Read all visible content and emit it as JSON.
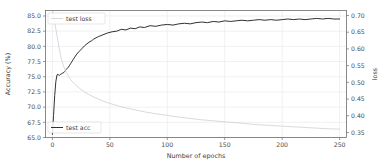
{
  "chart_data": {
    "type": "line",
    "title": "",
    "xlabel": "Number of epochs",
    "ylabel": "Accuracy (%)",
    "y2label": "loss",
    "xlim": [
      -6,
      256
    ],
    "ylim": [
      65.0,
      85.9
    ],
    "y2lim": [
      0.335,
      0.715
    ],
    "xticks": [
      0,
      50,
      100,
      150,
      200,
      250
    ],
    "xticklabels": [
      "0",
      "50",
      "100",
      "150",
      "200",
      "250"
    ],
    "yticks": [
      65.0,
      67.5,
      70.0,
      72.5,
      75.0,
      77.5,
      80.0,
      82.5,
      85.0
    ],
    "yticklabels": [
      "65.0",
      "67.5",
      "70.0",
      "72.5",
      "75.0",
      "77.5",
      "80.0",
      "82.5",
      "85.0"
    ],
    "y2ticks": [
      0.35,
      0.4,
      0.45,
      0.5,
      0.55,
      0.6,
      0.65,
      0.7
    ],
    "y2ticklabels": [
      "0.35",
      "0.40",
      "0.45",
      "0.50",
      "0.55",
      "0.60",
      "0.65",
      "0.70"
    ],
    "grid": true,
    "legend_position": "upper-left-and-lower-left",
    "series": [
      {
        "name": "test acc",
        "axis": "left",
        "color": "#1a1a1a",
        "linewidth": 0.9,
        "legend_label": "test acc",
        "x": [
          0,
          1,
          2,
          3,
          4,
          5,
          6,
          7,
          8,
          9,
          10,
          11,
          12,
          13,
          14,
          15,
          16,
          17,
          18,
          19,
          20,
          22,
          24,
          26,
          28,
          30,
          32,
          34,
          36,
          38,
          40,
          44,
          48,
          52,
          56,
          60,
          64,
          68,
          72,
          76,
          80,
          85,
          90,
          95,
          100,
          105,
          110,
          115,
          120,
          125,
          130,
          135,
          140,
          145,
          150,
          155,
          160,
          165,
          170,
          175,
          180,
          185,
          190,
          195,
          200,
          205,
          210,
          215,
          220,
          225,
          230,
          235,
          240,
          245,
          250
        ],
        "y": [
          65.5,
          68.6,
          71.9,
          74.2,
          75.3,
          75.4,
          75.2,
          75.4,
          75.5,
          75.6,
          75.7,
          75.9,
          76.2,
          76.4,
          76.6,
          76.9,
          77.2,
          77.5,
          77.8,
          78.1,
          78.4,
          78.9,
          79.3,
          79.7,
          80.1,
          80.4,
          80.7,
          80.9,
          81.2,
          81.4,
          81.6,
          81.9,
          82.2,
          82.4,
          82.5,
          82.8,
          82.7,
          83.0,
          82.9,
          83.2,
          83.1,
          83.4,
          83.3,
          83.5,
          83.6,
          83.5,
          83.7,
          83.8,
          83.7,
          83.9,
          84.0,
          83.9,
          84.1,
          84.0,
          84.2,
          84.1,
          84.2,
          84.3,
          84.2,
          84.3,
          84.4,
          84.3,
          84.4,
          84.3,
          84.4,
          84.5,
          84.4,
          84.5,
          84.4,
          84.5,
          84.6,
          84.5,
          84.6,
          84.5,
          84.5
        ]
      },
      {
        "name": "test loss",
        "axis": "right",
        "color": "#cfcfcf",
        "linewidth": 0.8,
        "legend_label": "test loss",
        "x": [
          0,
          1,
          2,
          3,
          4,
          5,
          6,
          7,
          8,
          9,
          10,
          12,
          14,
          16,
          18,
          20,
          24,
          28,
          32,
          36,
          40,
          45,
          50,
          55,
          60,
          70,
          80,
          90,
          100,
          110,
          120,
          130,
          140,
          150,
          160,
          170,
          180,
          190,
          200,
          210,
          220,
          230,
          240,
          250
        ],
        "y": [
          0.715,
          0.7,
          0.68,
          0.66,
          0.64,
          0.62,
          0.6,
          0.583,
          0.568,
          0.556,
          0.546,
          0.53,
          0.518,
          0.508,
          0.5,
          0.493,
          0.481,
          0.471,
          0.463,
          0.456,
          0.45,
          0.443,
          0.437,
          0.432,
          0.427,
          0.419,
          0.412,
          0.406,
          0.401,
          0.396,
          0.392,
          0.388,
          0.385,
          0.382,
          0.379,
          0.376,
          0.373,
          0.371,
          0.369,
          0.367,
          0.365,
          0.363,
          0.361,
          0.36
        ]
      }
    ]
  },
  "legend_top": {
    "label": "test loss"
  },
  "legend_bottom": {
    "label": "test acc"
  }
}
